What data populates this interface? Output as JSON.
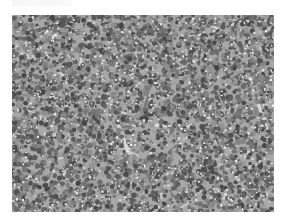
{
  "figure": {
    "caption_text": "",
    "image": {
      "kind": "histology-micrograph",
      "description": "Grayscale micrograph of densely packed small round cells (lymphoid tissue) with scattered pale streaks",
      "colors": {
        "background": "#ffffff",
        "tissue_dark": "#5a5a5a",
        "tissue_mid": "#9a9a9a",
        "tissue_light": "#e6e6e6"
      }
    }
  }
}
